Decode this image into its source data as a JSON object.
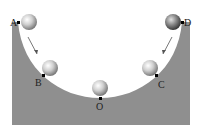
{
  "diagram": {
    "points": [
      {
        "label": "A",
        "x": 18,
        "y": 23
      },
      {
        "label": "B",
        "x": 43,
        "y": 76
      },
      {
        "label": "O",
        "x": 100,
        "y": 98
      },
      {
        "label": "C",
        "x": 157,
        "y": 76
      },
      {
        "label": "D",
        "x": 182,
        "y": 23
      }
    ],
    "colors": {
      "bowl": "#8f8f8f",
      "ball": "#c8c8c8",
      "background": "#ffffff"
    }
  }
}
